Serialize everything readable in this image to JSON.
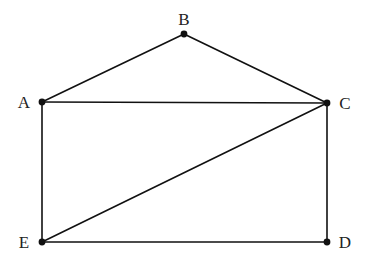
{
  "diagram": {
    "type": "graph",
    "background": "#ffffff",
    "stroke_color": "#111111",
    "vertices": [
      {
        "id": "A",
        "label": "A",
        "x": 42,
        "y": 102,
        "label_x": 24,
        "label_y": 108,
        "anchor": "middle"
      },
      {
        "id": "B",
        "label": "B",
        "x": 184,
        "y": 34,
        "label_x": 184,
        "label_y": 25,
        "anchor": "middle"
      },
      {
        "id": "C",
        "label": "C",
        "x": 327,
        "y": 103,
        "label_x": 345,
        "label_y": 109,
        "anchor": "middle"
      },
      {
        "id": "D",
        "label": "D",
        "x": 327,
        "y": 242,
        "label_x": 345,
        "label_y": 248,
        "anchor": "middle"
      },
      {
        "id": "E",
        "label": "E",
        "x": 42,
        "y": 242,
        "label_x": 24,
        "label_y": 248,
        "anchor": "middle"
      }
    ],
    "edges": [
      {
        "from": "A",
        "to": "B"
      },
      {
        "from": "B",
        "to": "C"
      },
      {
        "from": "A",
        "to": "C"
      },
      {
        "from": "A",
        "to": "E"
      },
      {
        "from": "C",
        "to": "D"
      },
      {
        "from": "E",
        "to": "D"
      },
      {
        "from": "E",
        "to": "C"
      }
    ]
  }
}
